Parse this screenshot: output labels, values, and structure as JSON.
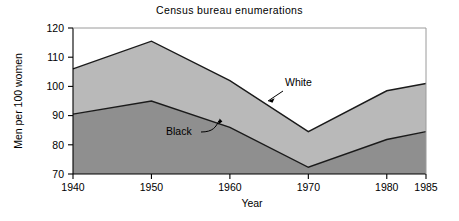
{
  "chart_data": {
    "type": "area",
    "title": "Census bureau enumerations",
    "xlabel": "Year",
    "ylabel": "Men per 100 women",
    "x": [
      1940,
      1950,
      1960,
      1970,
      1980,
      1985
    ],
    "xticklabels": [
      "1940",
      "1950",
      "1960",
      "1970",
      "1980",
      "1985"
    ],
    "yticks": [
      70,
      80,
      90,
      100,
      110,
      120
    ],
    "yticklabels": [
      "70",
      "80",
      "90",
      "100",
      "110",
      "120"
    ],
    "xlim": [
      1940,
      1985
    ],
    "ylim": [
      70,
      120
    ],
    "grid": false,
    "legend": "annotations-on-plot",
    "stacked": false,
    "series": [
      {
        "name": "White",
        "values": [
          106,
          115.5,
          102,
          84.5,
          98.5,
          101
        ],
        "fill_color": "#b9b9b9",
        "line_color": "#1a1a1a",
        "annotation": {
          "label": "White",
          "arrow": "straight",
          "points_to_x": 1964,
          "points_to_y": 94.5
        }
      },
      {
        "name": "Black",
        "values": [
          90.5,
          95,
          86,
          72.3,
          81.8,
          84.5
        ],
        "fill_color": "#8f8f8f",
        "line_color": "#1a1a1a",
        "annotation": {
          "label": "Black",
          "arrow": "curved",
          "points_to_x": 1959,
          "points_to_y": 86.4
        }
      }
    ],
    "annotations": [
      {
        "label": "White"
      },
      {
        "label": "Black"
      }
    ],
    "colors": {
      "background": "#ffffff",
      "axis": "#000000",
      "white_band": "#b9b9b9",
      "black_band": "#8f8f8f"
    }
  }
}
